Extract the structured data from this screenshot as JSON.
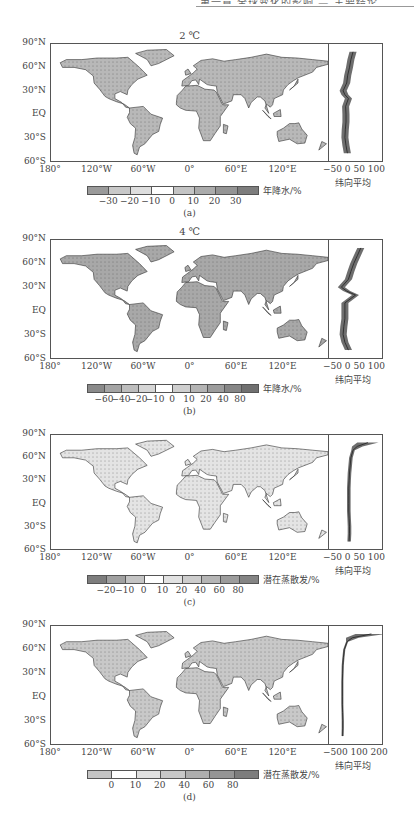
{
  "header": {
    "text": "第一章 全球变化的影响 — 主要结论"
  },
  "zonal_axis_label": "纬向平均",
  "map_yticks": [
    "90°N",
    "60°N",
    "30°N",
    "EQ",
    "30°S",
    "60°S"
  ],
  "map_xticks": [
    "180°",
    "120°W",
    "60°W",
    "0°",
    "60°E",
    "120°E"
  ],
  "panels": [
    {
      "id": "a",
      "title": "2 ℃",
      "caption": "(a)",
      "variable_label": "年降水/%",
      "colorbar_ticks": [
        "−30",
        "−20",
        "−10",
        "0",
        "10",
        "20",
        "30"
      ],
      "colorbar_colors": [
        "#9a9a9a",
        "#c8c8c8",
        "#dedede",
        "#ffffff",
        "#c4c4c4",
        "#ababab",
        "#949494",
        "#7d7d7d"
      ],
      "zonal_xticks": [
        "−50",
        "0",
        "50",
        "100"
      ],
      "land_fill": "#b8b8b8"
    },
    {
      "id": "b",
      "title": "4 ℃",
      "caption": "(b)",
      "variable_label": "年降水/%",
      "colorbar_ticks": [
        "−60",
        "−40",
        "−20",
        "−10",
        "0",
        "10",
        "20",
        "40",
        "80"
      ],
      "colorbar_colors": [
        "#8a8a8a",
        "#a4a4a4",
        "#bdbdbd",
        "#d6d6d6",
        "#ffffff",
        "#cfcfcf",
        "#b4b4b4",
        "#9c9c9c",
        "#868686",
        "#707070"
      ],
      "zonal_xticks": [
        "−50",
        "0",
        "50",
        "100"
      ],
      "land_fill": "#a8a8a8"
    },
    {
      "id": "c",
      "title": "",
      "caption": "(c)",
      "variable_label": "潜在蒸散发/%",
      "colorbar_ticks": [
        "−20",
        "−10",
        "0",
        "10",
        "20",
        "40",
        "60",
        "80"
      ],
      "colorbar_colors": [
        "#7d7d7d",
        "#a0a0a0",
        "#c4c4c4",
        "#ffffff",
        "#e2e2e2",
        "#cdcdcd",
        "#b5b5b5",
        "#9c9c9c",
        "#848484"
      ],
      "zonal_xticks": [
        "−50",
        "0",
        "50",
        "100"
      ],
      "land_fill": "#e4e4e4"
    },
    {
      "id": "d",
      "title": "",
      "caption": "(d)",
      "variable_label": "潜在蒸散发/%",
      "colorbar_ticks": [
        "0",
        "10",
        "20",
        "40",
        "60",
        "80"
      ],
      "colorbar_colors": [
        "#c4c4c4",
        "#ffffff",
        "#e0e0e0",
        "#c8c8c8",
        "#aeaeae",
        "#959595",
        "#7d7d7d"
      ],
      "zonal_xticks": [
        "−500",
        "100",
        "200"
      ],
      "land_fill": "#c8c8c8"
    }
  ],
  "chart_data": [
    {
      "type": "heatmap",
      "title": "2 ℃ — 年降水变化 (annual precipitation change, %)",
      "xlabel": "longitude",
      "ylabel": "latitude",
      "x_ticks": [
        "180°",
        "120°W",
        "60°W",
        "0°",
        "60°E",
        "120°E"
      ],
      "y_ticks": [
        "90°N",
        "60°N",
        "30°N",
        "EQ",
        "30°S",
        "60°S"
      ],
      "colorbar": {
        "label": "年降水/%",
        "levels": [
          -30,
          -20,
          -10,
          0,
          10,
          20,
          30
        ]
      },
      "zonal_mean": {
        "label": "纬向平均",
        "xlim": [
          -50,
          100
        ],
        "lat": [
          80,
          70,
          60,
          50,
          40,
          30,
          25,
          20,
          10,
          0,
          -10,
          -20,
          -30,
          -40,
          -50
        ],
        "mean": [
          18,
          12,
          8,
          3,
          0,
          -10,
          -5,
          5,
          -3,
          -2,
          -2,
          -4,
          -5,
          -2,
          2
        ]
      }
    },
    {
      "type": "heatmap",
      "title": "4 ℃ — 年降水变化 (annual precipitation change, %)",
      "xlabel": "longitude",
      "ylabel": "latitude",
      "x_ticks": [
        "180°",
        "120°W",
        "60°W",
        "0°",
        "60°E",
        "120°E"
      ],
      "y_ticks": [
        "90°N",
        "60°N",
        "30°N",
        "EQ",
        "30°S",
        "60°S"
      ],
      "colorbar": {
        "label": "年降水/%",
        "levels": [
          -60,
          -40,
          -20,
          -10,
          0,
          10,
          20,
          40,
          80
        ]
      },
      "zonal_mean": {
        "label": "纬向平均",
        "xlim": [
          -50,
          100
        ],
        "lat": [
          80,
          70,
          60,
          50,
          40,
          30,
          25,
          20,
          10,
          0,
          -10,
          -20,
          -30,
          -40,
          -50
        ],
        "mean": [
          40,
          30,
          20,
          12,
          5,
          -15,
          0,
          25,
          -5,
          -5,
          -5,
          -8,
          -10,
          -5,
          5
        ]
      }
    },
    {
      "type": "heatmap",
      "title": "2 ℃ — 潜在蒸散发变化 (potential evapotranspiration change, %)",
      "xlabel": "longitude",
      "ylabel": "latitude",
      "x_ticks": [
        "180°",
        "120°W",
        "60°W",
        "0°",
        "60°E",
        "120°E"
      ],
      "y_ticks": [
        "90°N",
        "60°N",
        "30°N",
        "EQ",
        "30°S",
        "60°S"
      ],
      "colorbar": {
        "label": "潜在蒸散发/%",
        "levels": [
          -20,
          -10,
          0,
          10,
          20,
          40,
          60,
          80
        ]
      },
      "zonal_mean": {
        "label": "纬向平均",
        "xlim": [
          -50,
          100
        ],
        "lat": [
          80,
          75,
          70,
          60,
          50,
          40,
          30,
          20,
          10,
          0,
          -10,
          -20,
          -30,
          -40,
          -50
        ],
        "mean": [
          60,
          30,
          18,
          12,
          10,
          8,
          7,
          6,
          6,
          6,
          6,
          7,
          8,
          8,
          7
        ]
      }
    },
    {
      "type": "heatmap",
      "title": "4 ℃ — 潜在蒸散发变化 (potential evapotranspiration change, %)",
      "xlabel": "longitude",
      "ylabel": "latitude",
      "x_ticks": [
        "180°",
        "120°W",
        "60°W",
        "0°",
        "60°E",
        "120°E"
      ],
      "y_ticks": [
        "90°N",
        "60°N",
        "30°N",
        "EQ",
        "30°S",
        "60°S"
      ],
      "colorbar": {
        "label": "潜在蒸散发/%",
        "levels": [
          0,
          10,
          20,
          40,
          60,
          80
        ]
      },
      "zonal_mean": {
        "label": "纬向平均",
        "xlim": [
          -50,
          200
        ],
        "lat": [
          80,
          75,
          70,
          60,
          50,
          40,
          30,
          20,
          10,
          0,
          -10,
          -20,
          -30,
          -40,
          -50
        ],
        "mean": [
          150,
          60,
          35,
          22,
          18,
          15,
          14,
          13,
          13,
          13,
          13,
          14,
          15,
          15,
          14
        ]
      }
    }
  ]
}
